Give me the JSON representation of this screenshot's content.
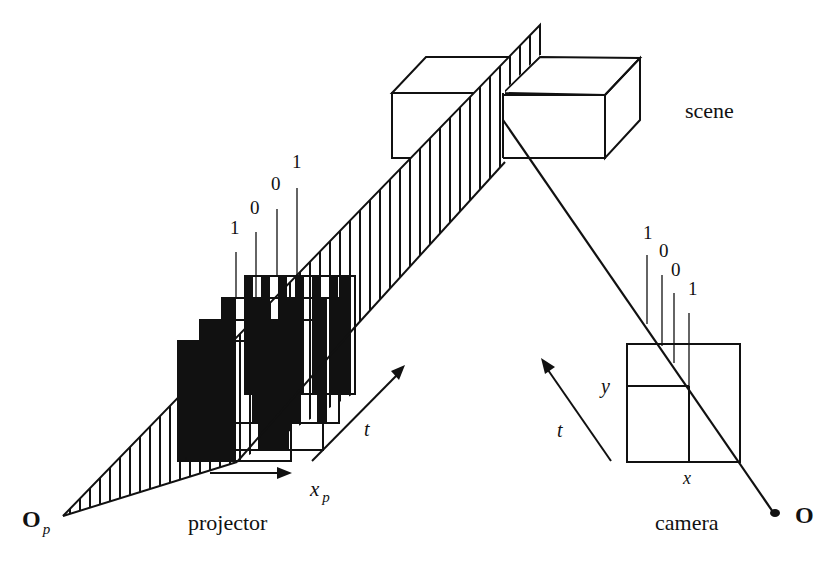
{
  "figure": {
    "type": "structured-light temporal coding diagram",
    "colors": {
      "ink": "#111111",
      "background": "#ffffff"
    }
  },
  "labels": {
    "scene": "scene",
    "projector": "projector",
    "camera": "camera",
    "projector_origin": "O",
    "projector_origin_sub": "p",
    "camera_origin": "O",
    "projector_axis_x": "x",
    "projector_axis_x_sub": "p",
    "projector_time_axis": "t",
    "camera_time_axis": "t",
    "camera_axis_x": "x",
    "camera_axis_y": "y"
  },
  "projector_code_bits": [
    "1",
    "0",
    "0",
    "1"
  ],
  "camera_code_bits": [
    "1",
    "0",
    "0",
    "1"
  ]
}
